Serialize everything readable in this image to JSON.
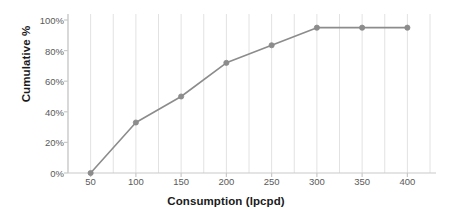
{
  "chart_data": {
    "type": "line",
    "title": "",
    "xlabel": "Consumption (lpcpd)",
    "ylabel": "Cumulative %",
    "x": [
      50,
      100,
      150,
      200,
      250,
      300,
      350,
      400
    ],
    "values": [
      0,
      33,
      50,
      72,
      83.5,
      95,
      95,
      95
    ],
    "point_labels": [
      "0%",
      "33%",
      "50%",
      "72%",
      "83.5%",
      "95%",
      "95%",
      "95%"
    ],
    "xtick_labels": [
      "50",
      "100",
      "150",
      "200",
      "250",
      "300",
      "350",
      "400"
    ],
    "xtick_values": [
      50,
      100,
      150,
      200,
      250,
      300,
      350,
      400
    ],
    "ytick_labels": [
      "0%",
      "20%",
      "40%",
      "60%",
      "80%",
      "100%"
    ],
    "ytick_values": [
      0,
      20,
      40,
      60,
      80,
      100
    ],
    "xlim": [
      25,
      425
    ],
    "ylim": [
      0,
      100
    ],
    "grid": "vertical-minor",
    "gridline_step": 25,
    "legend": "none",
    "series_name": "Cumulative %",
    "colors": {
      "line": "#8c8c8c",
      "marker": "#8c8c8c",
      "gridline": "#e2e2e2",
      "axis": "#c9c9c9",
      "tick_text": "#5a5a5a",
      "title_text": "#1a1a1a",
      "background": "#ffffff"
    }
  }
}
